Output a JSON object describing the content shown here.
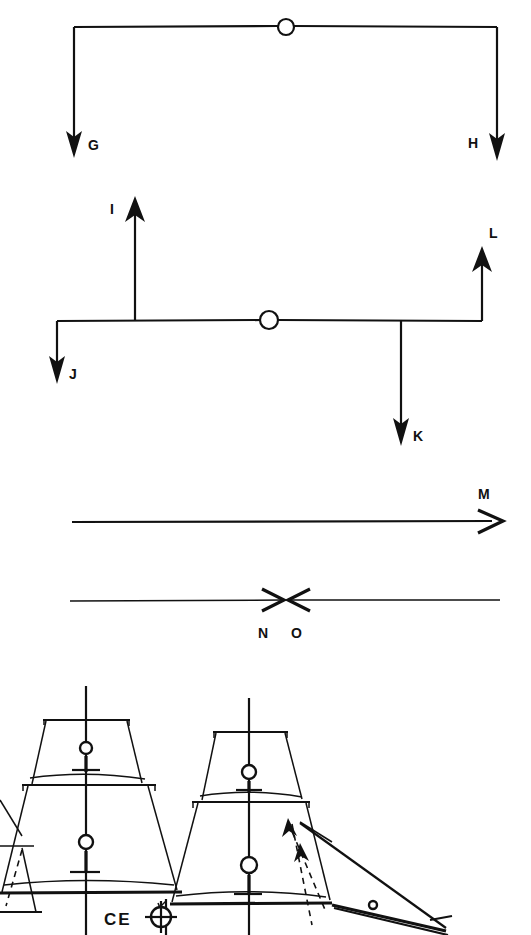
{
  "figure": {
    "ink_color": "#111111",
    "background_color": "#ffffff",
    "width": 531,
    "height": 935
  },
  "diagrams": [
    {
      "id": "diagram-gh",
      "description": "Inverted U shaped bracket with central pivot circle; two downward force arrows at the ends",
      "pivot": {
        "cx": 286,
        "cy": 27,
        "r": 8
      },
      "labels": [
        {
          "key": "G",
          "text": "G",
          "x": 88,
          "y": 150
        },
        {
          "key": "H",
          "text": "H",
          "x": 472,
          "y": 148
        }
      ],
      "arrows": [
        {
          "key": "G",
          "direction": "down",
          "x": 74,
          "from_y": 27,
          "to_y": 155
        },
        {
          "key": "H",
          "direction": "down",
          "x": 497,
          "from_y": 27,
          "to_y": 160
        }
      ]
    },
    {
      "id": "diagram-ijkl",
      "description": "Horizontal beam with central pivot circle; upward arrows I and L, downward arrows J and K",
      "pivot": {
        "cx": 269,
        "cy": 320,
        "r": 9
      },
      "beam": {
        "x1": 57,
        "x2": 482,
        "y": 320
      },
      "labels": [
        {
          "key": "I",
          "text": "I",
          "x": 113,
          "y": 212
        },
        {
          "key": "J",
          "text": "J",
          "x": 70,
          "y": 378
        },
        {
          "key": "K",
          "text": "K",
          "x": 414,
          "y": 440
        },
        {
          "key": "L",
          "text": "L",
          "x": 491,
          "y": 235
        }
      ],
      "arrows": [
        {
          "key": "I",
          "direction": "up",
          "x": 135,
          "from_y": 320,
          "to_y": 198
        },
        {
          "key": "J",
          "direction": "down",
          "x": 57,
          "from_y": 320,
          "to_y": 382
        },
        {
          "key": "K",
          "direction": "down",
          "x": 401,
          "from_y": 320,
          "to_y": 443
        },
        {
          "key": "L",
          "direction": "up",
          "x": 482,
          "from_y": 320,
          "to_y": 248
        }
      ]
    },
    {
      "id": "diagram-m",
      "description": "Single long horizontal arrow pointing right",
      "line": {
        "x1": 72,
        "x2": 502,
        "y": 521
      },
      "labels": [
        {
          "key": "M",
          "text": "M",
          "x": 482,
          "y": 498
        }
      ],
      "arrows": [
        {
          "key": "M",
          "direction": "right",
          "y": 521,
          "from_x": 72,
          "to_x": 503
        }
      ]
    },
    {
      "id": "diagram-no",
      "description": "Two opposing horizontal arrows meeting at the centre of a long line",
      "line": {
        "x1": 70,
        "x2": 500,
        "y": 600
      },
      "labels": [
        {
          "key": "N",
          "text": "N",
          "x": 262,
          "y": 637
        },
        {
          "key": "O",
          "text": "O",
          "x": 294,
          "y": 637
        }
      ],
      "arrows": [
        {
          "key": "N",
          "direction": "right",
          "y": 600,
          "from_x": 70,
          "to_x": 284
        },
        {
          "key": "O",
          "direction": "left",
          "y": 600,
          "from_x": 500,
          "to_x": 288
        }
      ]
    }
  ],
  "sail_plan": {
    "id": "ship-sail-plan",
    "description": "Partial square rigged ship sail plan showing mainmast, foremast, headsails and bowsprit",
    "center_of_effort": {
      "label": "CE",
      "label_x": 105,
      "label_y": 924,
      "marker_x": 161,
      "marker_y": 917,
      "marker_radius": 10
    },
    "masts": [
      {
        "name": "mainmast",
        "x": 86,
        "top_y": 686,
        "bottom_y": 935,
        "hoops": [
          {
            "cx": 86,
            "cy": 748,
            "r": 6
          },
          {
            "cx": 86,
            "cy": 842,
            "r": 7
          }
        ],
        "yards": [
          {
            "y": 721,
            "x1": 42,
            "x2": 130
          },
          {
            "y": 784,
            "x1": 22,
            "x2": 155
          },
          {
            "y": 891,
            "x1": 0,
            "x2": 182
          }
        ]
      },
      {
        "name": "foremast",
        "x": 249,
        "top_y": 697,
        "bottom_y": 935,
        "hoops": [
          {
            "cx": 249,
            "cy": 772,
            "r": 7
          },
          {
            "cx": 249,
            "cy": 865,
            "r": 8
          }
        ],
        "yards": [
          {
            "y": 732,
            "x1": 212,
            "x2": 286
          },
          {
            "y": 800,
            "x1": 192,
            "x2": 308
          },
          {
            "y": 900,
            "x1": 170,
            "x2": 330
          }
        ]
      }
    ],
    "headsails": {
      "description": "Jib and staysail triangles forward of foremast with dashed luff lines",
      "bowsprit_tip_x": 446,
      "bowsprit_tip_y": 928
    },
    "deck_marker": {
      "description": "Small circle on the headsail area",
      "cx": 373,
      "cy": 905,
      "r": 4
    }
  }
}
